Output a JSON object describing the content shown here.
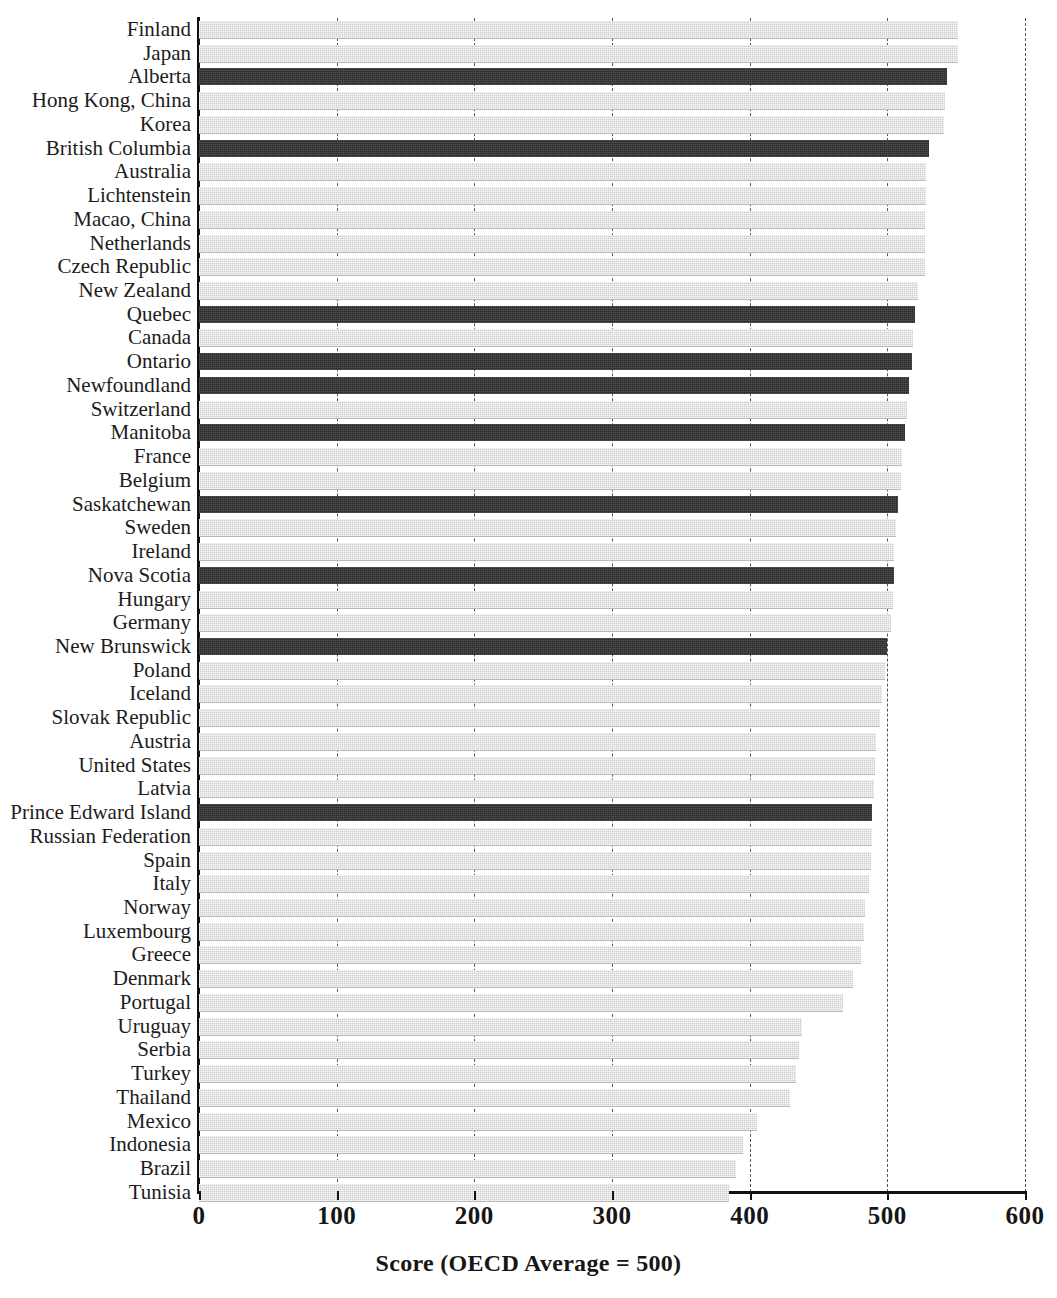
{
  "chart_data": {
    "type": "bar",
    "orientation": "horizontal",
    "title": "",
    "xlabel": "Score (OECD Average = 500)",
    "ylabel": "",
    "xlim": [
      0,
      600
    ],
    "xticks": [
      0,
      100,
      200,
      300,
      400,
      500,
      600
    ],
    "xtick_labels": [
      "0",
      "100",
      "200",
      "300",
      "400",
      "500",
      "600"
    ],
    "grid": true,
    "grid_axis": "x",
    "grid_style": "dashed",
    "legend": null,
    "colors": {
      "highlight_dark": "#2b2b2b",
      "default_light": "#cfcfcf",
      "axis": "#111111",
      "gridline": "#6e6e6e",
      "text": "#1c1c1c"
    },
    "series_note": "Dark bars are Canadian provinces; light bars are countries/economies.",
    "categories": [
      "Finland",
      "Japan",
      "Alberta",
      "Hong Kong, China",
      "Korea",
      "British Columbia",
      "Australia",
      "Lichtenstein",
      "Macao, China",
      "Netherlands",
      "Czech Republic",
      "New Zealand",
      "Quebec",
      "Canada",
      "Ontario",
      "Newfoundland",
      "Switzerland",
      "Manitoba",
      "France",
      "Belgium",
      "Saskatchewan",
      "Sweden",
      "Ireland",
      "Nova Scotia",
      "Hungary",
      "Germany",
      "New Brunswick",
      "Poland",
      "Iceland",
      "Slovak Republic",
      "Austria",
      "United States",
      "Latvia",
      "Prince Edward Island",
      "Russian Federation",
      "Spain",
      "Italy",
      "Norway",
      "Luxembourg",
      "Greece",
      "Denmark",
      "Portugal",
      "Uruguay",
      "Serbia",
      "Turkey",
      "Thailand",
      "Mexico",
      "Indonesia",
      "Brazil",
      "Tunisia"
    ],
    "values": [
      551,
      551,
      543,
      542,
      541,
      530,
      528,
      528,
      527,
      527,
      527,
      522,
      520,
      519,
      518,
      516,
      514,
      513,
      511,
      510,
      508,
      506,
      505,
      505,
      504,
      503,
      500,
      498,
      496,
      495,
      492,
      491,
      490,
      489,
      489,
      488,
      487,
      484,
      483,
      481,
      475,
      468,
      438,
      436,
      434,
      429,
      405,
      395,
      390,
      385
    ],
    "highlighted": [
      "Alberta",
      "British Columbia",
      "Quebec",
      "Ontario",
      "Newfoundland",
      "Manitoba",
      "Saskatchewan",
      "Nova Scotia",
      "New Brunswick",
      "Prince Edward Island"
    ]
  }
}
